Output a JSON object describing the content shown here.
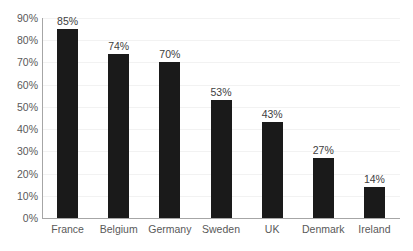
{
  "chart_data": {
    "type": "bar",
    "title": "",
    "subtitle": "",
    "xlabel": "",
    "ylabel": "",
    "categories": [
      "France",
      "Belgium",
      "Germany",
      "Sweden",
      "UK",
      "Denmark",
      "Ireland"
    ],
    "values": [
      85,
      74,
      70,
      53,
      43,
      27,
      14
    ],
    "data_labels": [
      "85%",
      "74%",
      "70%",
      "53%",
      "43%",
      "27%",
      "14%"
    ],
    "ylim": [
      0,
      90
    ],
    "ytick_values": [
      90,
      80,
      70,
      60,
      50,
      40,
      30,
      20,
      10,
      0
    ],
    "ytick_labels": [
      "90%",
      "80%",
      "70%",
      "60%",
      "50%",
      "40%",
      "30%",
      "20%",
      "10%",
      "0%"
    ],
    "grid": true,
    "grid_axis": "y",
    "legend": false,
    "legend_position": "none",
    "series": [
      {
        "name": "",
        "values": [
          85,
          74,
          70,
          53,
          43,
          27,
          14
        ]
      }
    ],
    "colors": {
      "bar": "#1a1a1a",
      "gridline": "#f2f2f2",
      "axis": "#a6a6a6",
      "tick_label": "#595959",
      "data_label": "#404040",
      "background": "#ffffff"
    }
  }
}
